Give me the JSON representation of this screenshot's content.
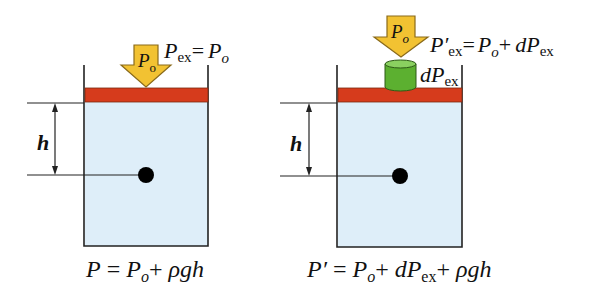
{
  "colors": {
    "liquid": "#deeef9",
    "piston": "#d63b1c",
    "arrow_fill": "#f2c232",
    "arrow_stroke": "#8a6a1a",
    "weight": "#5cb030",
    "weight_top": "#8ad060",
    "line": "#222222"
  },
  "left_panel": {
    "arrow_label": {
      "main": "P",
      "sub": "o"
    },
    "pressure_label": {
      "lhs_main": "P",
      "lhs_sub": "ex",
      "eq": "=",
      "rhs_main": "P",
      "rhs_sub": "o"
    },
    "height_label": "h",
    "formula": {
      "p": "P",
      "eq": " = ",
      "po": "P",
      "po_sub": "o",
      "plus": "+ ",
      "rest": "ρgh"
    }
  },
  "right_panel": {
    "arrow_label": {
      "main": "P",
      "sub": "o"
    },
    "pressure_label": {
      "lhs_main": "P′",
      "lhs_sub": "ex",
      "eq": "=",
      "po": "P",
      "po_sub": "o",
      "plus": "+",
      "d": "dP",
      "d_sub": "ex"
    },
    "weight_label": {
      "main": "dP",
      "sub": "ex"
    },
    "height_label": "h",
    "formula": {
      "p": "P′",
      "eq": " = ",
      "po": "P",
      "po_sub": "o",
      "plus1": "+ ",
      "d": "dP",
      "d_sub": "ex",
      "plus2": "+ ",
      "rest": "ρgh"
    }
  }
}
